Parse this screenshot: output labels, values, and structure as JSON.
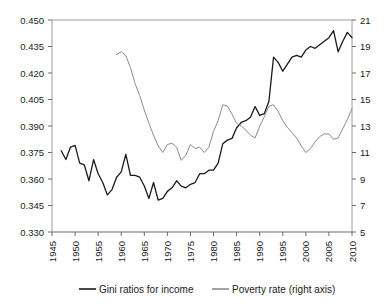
{
  "chart_data": {
    "type": "line",
    "title": "",
    "subtitle": "",
    "xlabel": "",
    "ylabel": "",
    "y2label": "",
    "grid": false,
    "legend_position": "bottom",
    "xlim": [
      1945,
      2010
    ],
    "xticks": [
      "1945",
      "1950",
      "1955",
      "1960",
      "1965",
      "1970",
      "1975",
      "1980",
      "1985",
      "1990",
      "1995",
      "2000",
      "2005",
      "2010"
    ],
    "ylim": [
      0.33,
      0.45
    ],
    "yticks": [
      "0.330",
      "0.345",
      "0.360",
      "0.375",
      "0.390",
      "0.405",
      "0.420",
      "0.435",
      "0.450"
    ],
    "y2lim": [
      5,
      21
    ],
    "y2ticks": [
      "5",
      "7",
      "9",
      "11",
      "13",
      "15",
      "17",
      "19",
      "21"
    ],
    "series": [
      {
        "name": "Gini ratios for income",
        "axis": "left",
        "color": "#1a1a1a",
        "x": [
          1947,
          1948,
          1949,
          1950,
          1951,
          1952,
          1953,
          1954,
          1955,
          1956,
          1957,
          1958,
          1959,
          1960,
          1961,
          1962,
          1963,
          1964,
          1965,
          1966,
          1967,
          1968,
          1969,
          1970,
          1971,
          1972,
          1973,
          1974,
          1975,
          1976,
          1977,
          1978,
          1979,
          1980,
          1981,
          1982,
          1983,
          1984,
          1985,
          1986,
          1987,
          1988,
          1989,
          1990,
          1991,
          1992,
          1993,
          1994,
          1995,
          1996,
          1997,
          1998,
          1999,
          2000,
          2001,
          2002,
          2003,
          2004,
          2005,
          2006,
          2007,
          2008,
          2009,
          2010
        ],
        "values": [
          0.376,
          0.371,
          0.378,
          0.379,
          0.369,
          0.368,
          0.359,
          0.371,
          0.363,
          0.358,
          0.351,
          0.354,
          0.361,
          0.364,
          0.374,
          0.362,
          0.362,
          0.361,
          0.356,
          0.349,
          0.358,
          0.348,
          0.349,
          0.353,
          0.355,
          0.359,
          0.356,
          0.355,
          0.357,
          0.358,
          0.363,
          0.363,
          0.365,
          0.365,
          0.369,
          0.38,
          0.382,
          0.383,
          0.389,
          0.392,
          0.393,
          0.395,
          0.401,
          0.396,
          0.397,
          0.404,
          0.429,
          0.426,
          0.421,
          0.425,
          0.429,
          0.43,
          0.429,
          0.433,
          0.435,
          0.434,
          0.436,
          0.438,
          0.44,
          0.444,
          0.432,
          0.438,
          0.443,
          0.44
        ]
      },
      {
        "name": "Poverty rate (right axis)",
        "axis": "right",
        "color": "#8c8c8c",
        "x": [
          1959,
          1960,
          1961,
          1962,
          1963,
          1964,
          1965,
          1966,
          1967,
          1968,
          1969,
          1970,
          1971,
          1972,
          1973,
          1974,
          1975,
          1976,
          1977,
          1978,
          1979,
          1980,
          1981,
          1982,
          1983,
          1984,
          1985,
          1986,
          1987,
          1988,
          1989,
          1990,
          1991,
          1992,
          1993,
          1994,
          1995,
          1996,
          1997,
          1998,
          1999,
          2000,
          2001,
          2002,
          2003,
          2004,
          2005,
          2006,
          2007,
          2008,
          2009,
          2010
        ],
        "values": [
          18.4,
          18.6,
          18.3,
          17.4,
          16.2,
          15.3,
          14.2,
          13.2,
          12.3,
          11.5,
          11.0,
          11.6,
          11.7,
          11.4,
          10.4,
          10.8,
          11.6,
          11.3,
          11.4,
          11.0,
          11.4,
          12.6,
          13.4,
          14.6,
          14.5,
          13.9,
          13.2,
          13.0,
          12.7,
          12.3,
          12.1,
          13.0,
          13.7,
          14.5,
          14.6,
          14.1,
          13.4,
          12.9,
          12.5,
          12.1,
          11.5,
          11.0,
          11.3,
          11.8,
          12.2,
          12.4,
          12.4,
          12.0,
          12.1,
          12.8,
          13.5,
          14.3
        ]
      }
    ],
    "legend": [
      {
        "label": "Gini ratios for income",
        "color": "#1a1a1a"
      },
      {
        "label": "Poverty rate (right axis)",
        "color": "#8c8c8c"
      }
    ]
  },
  "layout": {
    "plot": {
      "left": 52,
      "right": 352,
      "top": 20,
      "bottom": 232
    }
  }
}
